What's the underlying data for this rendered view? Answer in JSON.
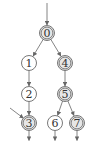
{
  "diagram": {
    "type": "directed-graph",
    "nodes": [
      {
        "id": "0",
        "label": "0",
        "x": 47,
        "y": 33,
        "shaded": true
      },
      {
        "id": "1",
        "label": "1",
        "x": 29,
        "y": 63,
        "shaded": false
      },
      {
        "id": "4",
        "label": "4",
        "x": 65,
        "y": 63,
        "shaded": true
      },
      {
        "id": "2",
        "label": "2",
        "x": 29,
        "y": 94,
        "shaded": false
      },
      {
        "id": "5",
        "label": "5",
        "x": 65,
        "y": 94,
        "shaded": true
      },
      {
        "id": "3",
        "label": "3",
        "x": 29,
        "y": 123,
        "shaded": true
      },
      {
        "id": "6",
        "label": "6",
        "x": 55,
        "y": 123,
        "shaded": false
      },
      {
        "id": "7",
        "label": "7",
        "x": 77,
        "y": 123,
        "shaded": true
      }
    ],
    "edges": [
      {
        "from": "entry-top",
        "to": "0"
      },
      {
        "from": "0",
        "to": "1"
      },
      {
        "from": "0",
        "to": "4"
      },
      {
        "from": "1",
        "to": "2"
      },
      {
        "from": "4",
        "to": "5"
      },
      {
        "from": "2",
        "to": "3"
      },
      {
        "from": "5",
        "to": "6"
      },
      {
        "from": "5",
        "to": "7"
      },
      {
        "from": "entry-left",
        "to": "3"
      },
      {
        "from": "3",
        "to": "exit"
      },
      {
        "from": "6",
        "to": "exit"
      },
      {
        "from": "7",
        "to": "exit"
      }
    ],
    "colors": {
      "shaded": "#e6e6e6",
      "unshaded": "#ffffff",
      "stroke": "#555555"
    }
  }
}
